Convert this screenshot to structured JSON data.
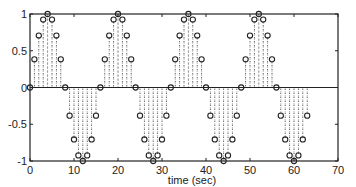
{
  "chart_data": {
    "type": "scatter",
    "style": "stem plot with open circle markers and dotted fill",
    "title": "",
    "xlabel": "time (sec)",
    "ylabel": "",
    "xlim": [
      0,
      70
    ],
    "ylim": [
      -1,
      1
    ],
    "xticks": [
      0,
      10,
      20,
      30,
      40,
      50,
      60,
      70
    ],
    "yticks": [
      -1,
      -0.5,
      0,
      0.5,
      1
    ],
    "xtick_labels": [
      "0",
      "10",
      "20",
      "30",
      "40",
      "50",
      "60",
      "70"
    ],
    "ytick_labels": [
      "-1",
      "-0.5",
      "0",
      "0.5",
      "1"
    ],
    "grid": false,
    "legend": null,
    "baseline": 0,
    "series": [
      {
        "name": "sin(2*pi*n/16)",
        "x": [
          0,
          1,
          2,
          3,
          4,
          5,
          6,
          7,
          8,
          9,
          10,
          11,
          12,
          13,
          14,
          15,
          16,
          17,
          18,
          19,
          20,
          21,
          22,
          23,
          24,
          25,
          26,
          27,
          28,
          29,
          30,
          31,
          32,
          33,
          34,
          35,
          36,
          37,
          38,
          39,
          40,
          41,
          42,
          43,
          44,
          45,
          46,
          47,
          48,
          49,
          50,
          51,
          52,
          53,
          54,
          55,
          56,
          57,
          58,
          59,
          60,
          61,
          62,
          63
        ],
        "values": [
          0,
          0.383,
          0.707,
          0.924,
          1,
          0.924,
          0.707,
          0.383,
          0,
          -0.383,
          -0.707,
          -0.924,
          -1,
          -0.924,
          -0.707,
          -0.383,
          0,
          0.383,
          0.707,
          0.924,
          1,
          0.924,
          0.707,
          0.383,
          0,
          -0.383,
          -0.707,
          -0.924,
          -1,
          -0.924,
          -0.707,
          -0.383,
          0,
          0.383,
          0.707,
          0.924,
          1,
          0.924,
          0.707,
          0.383,
          0,
          -0.383,
          -0.707,
          -0.924,
          -1,
          -0.924,
          -0.707,
          -0.383,
          0,
          0.383,
          0.707,
          0.924,
          1,
          0.924,
          0.707,
          0.383,
          0,
          -0.383,
          -0.707,
          -0.924,
          -1,
          -0.924,
          -0.707,
          -0.383
        ]
      }
    ]
  },
  "layout": {
    "plot_left": 30,
    "plot_right": 338,
    "plot_top": 14,
    "plot_bottom": 161
  }
}
